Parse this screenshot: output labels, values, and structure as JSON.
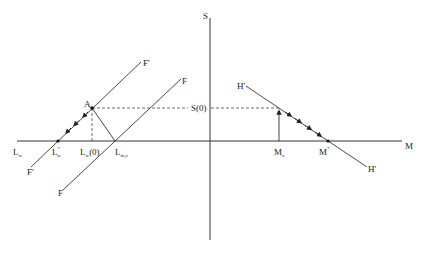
{
  "diagram": {
    "colors": {
      "line": "#333333",
      "dashed": "#444444",
      "text": "#222222"
    },
    "axes": {
      "horizontal": {
        "label": "M",
        "left_label": "L",
        "left_label_sub": "w"
      },
      "vertical": {
        "label": "S"
      }
    },
    "labels": {
      "A": "A",
      "S0": "S(0)",
      "F_prime_top": "F'",
      "F_prime_bottom": "F'",
      "F_top": "F",
      "F_bottom": "F",
      "H_prime_top": "H'",
      "H_prime_bottom": "H'",
      "L_star_w": {
        "main": "L",
        "sup": "*",
        "sub": "w"
      },
      "L_w_0": {
        "main": "L",
        "sub": "w",
        "suffix": "(0)"
      },
      "L_mc": {
        "main": "L",
        "sub": "m,c"
      },
      "M_o": {
        "main": "M",
        "sub": "o"
      },
      "M_star": {
        "main": "M",
        "sup": "*"
      }
    }
  }
}
